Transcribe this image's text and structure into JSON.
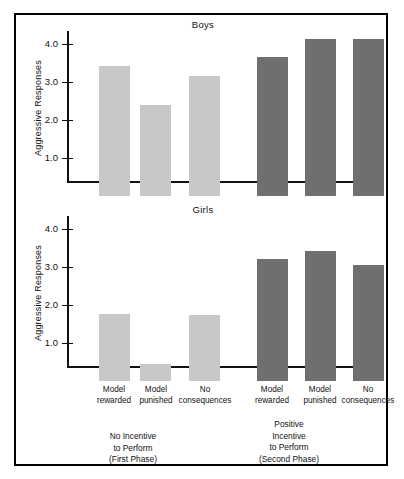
{
  "chart_data": {
    "type": "bar",
    "title": "",
    "xlabel": "",
    "ylabel": "Aggressive Responses",
    "ylim": [
      0,
      4.4
    ],
    "yticks": [
      1.0,
      2.0,
      3.0,
      4.0
    ],
    "ytick_labels": [
      "1.0",
      "2.0",
      "3.0",
      "4.0"
    ],
    "grid": false,
    "legend": "none",
    "categories": [
      "Model rewarded",
      "Model punished",
      "No consequences",
      "Model rewarded",
      "Model punished",
      "No consequences"
    ],
    "panels": [
      {
        "name": "Boys",
        "values": [
          3.42,
          2.4,
          3.15,
          3.67,
          4.12,
          4.12
        ]
      },
      {
        "name": "Girls",
        "values": [
          1.77,
          0.45,
          1.75,
          3.2,
          3.42,
          3.05
        ]
      }
    ],
    "groups": [
      {
        "label": "No Incentive to Perform (First Phase)",
        "lines": [
          "No Incentive",
          "to Perform",
          "(First Phase)"
        ],
        "color": "#c8c8c8",
        "bars": [
          0,
          1,
          2
        ]
      },
      {
        "label": "Positive Incentive to Perform (Second Phase)",
        "lines": [
          "Positive",
          "Incentive",
          "to Perform",
          "(Second Phase)"
        ],
        "color": "#6f6f6f",
        "bars": [
          3,
          4,
          5
        ]
      }
    ]
  },
  "panels": {
    "boys": {
      "title": "Boys",
      "ylabel": "Aggressive Responses",
      "ytick_labels": [
        "4.0",
        "3.0",
        "2.0",
        "1.0"
      ],
      "bars": [
        {
          "value": "3.42",
          "shade": "light"
        },
        {
          "value": "2.40",
          "shade": "light"
        },
        {
          "value": "3.15",
          "shade": "light"
        },
        {
          "value": "3.67",
          "shade": "dark"
        },
        {
          "value": "4.12",
          "shade": "dark"
        },
        {
          "value": "4.12",
          "shade": "dark"
        }
      ]
    },
    "girls": {
      "title": "Girls",
      "ylabel": "Aggressive Responses",
      "ytick_labels": [
        "4.0",
        "3.0",
        "2.0",
        "1.0"
      ],
      "bars": [
        {
          "value": "1.77",
          "shade": "light"
        },
        {
          "value": "0.45",
          "shade": "light"
        },
        {
          "value": "1.75",
          "shade": "light"
        },
        {
          "value": "3.20",
          "shade": "dark"
        },
        {
          "value": "3.42",
          "shade": "dark"
        },
        {
          "value": "3.05",
          "shade": "dark"
        }
      ]
    }
  },
  "xaxis": {
    "labels": [
      {
        "line1": "Model",
        "line2": "rewarded"
      },
      {
        "line1": "Model",
        "line2": "punished"
      },
      {
        "line1": "No",
        "line2": "consequences"
      },
      {
        "line1": "Model",
        "line2": "rewarded"
      },
      {
        "line1": "Model",
        "line2": "punished"
      },
      {
        "line1": "No",
        "line2": "consequences"
      }
    ]
  },
  "phases": [
    {
      "l1": "",
      "l2": "No Incentive",
      "l3": "to Perform",
      "l4": "(First Phase)"
    },
    {
      "l1": "Positive",
      "l2": "Incentive",
      "l3": "to Perform",
      "l4": "(Second Phase)"
    }
  ],
  "colors": {
    "light_bar": "#c8c8c8",
    "dark_bar": "#6f6f6f",
    "axis": "#111111",
    "background": "#ffffff"
  }
}
